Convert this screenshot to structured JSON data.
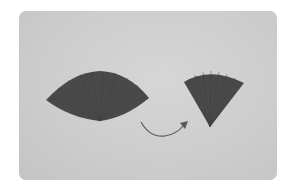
{
  "image": {
    "description": "Photo of two pleated paper fan shapes on a light gray background; a curved arrow points from the wider fan to the narrower folded fan.",
    "background_color": "#cfcfcf",
    "fan_color": "#4a4a4a",
    "arrow_color": "#5a5a5a",
    "objects": [
      {
        "name": "wide-fan",
        "label": ""
      },
      {
        "name": "narrow-fan",
        "label": ""
      },
      {
        "name": "curved-arrow",
        "label": ""
      }
    ]
  }
}
